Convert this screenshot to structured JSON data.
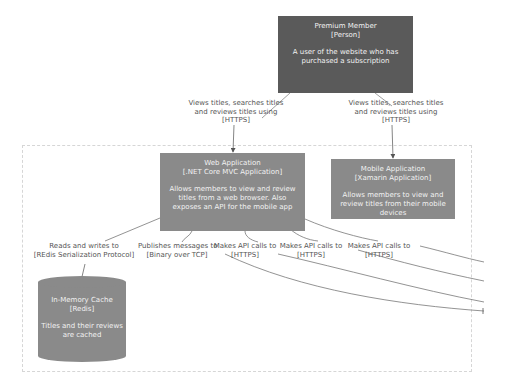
{
  "boundary": {},
  "person": {
    "name": "Premium Member",
    "type": "[Person]",
    "description": "A user of the website who has purchased a subscription"
  },
  "web_app": {
    "name": "Web Application",
    "type": "[.NET Core MVC Application]",
    "description": "Allows members to view and review titles from a web browser. Also exposes an API for the mobile app"
  },
  "mobile_app": {
    "name": "Mobile Application",
    "type": "[Xamarin Application]",
    "description": "Allows members to view and review titles from their mobile devices"
  },
  "cache": {
    "name": "In-Memory Cache",
    "type": "[Redis]",
    "description": "Titles and their reviews are cached"
  },
  "relations": [
    {
      "line1": "Views titles, searches titles",
      "line2": "and reviews titles using",
      "line3": "[HTTPS]"
    },
    {
      "line1": "Views titles, searches titles",
      "line2": "and reviews titles using",
      "line3": "[HTTPS]"
    },
    {
      "line1": "Reads and writes to",
      "line2": "[REdis Serialization Protocol]"
    },
    {
      "line1": "Publishes messages to",
      "line2": "[Binary over TCP]"
    },
    {
      "line1": "Makes API calls to",
      "line2": "[HTTPS]"
    },
    {
      "line1": "Makes API calls to",
      "line2": "[HTTPS]"
    },
    {
      "line1": "Makes API calls to",
      "line2": "[HTTPS]"
    }
  ],
  "colors": {
    "person": "#5a5a5a",
    "container": "#8a8a8a",
    "edge": "#707070",
    "label": "#555555"
  }
}
